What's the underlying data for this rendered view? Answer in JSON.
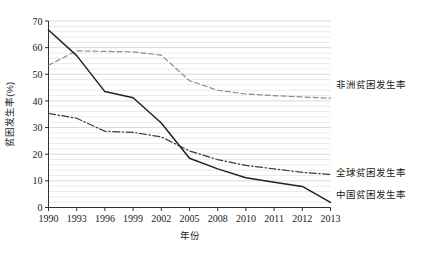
{
  "chart_data": {
    "type": "line",
    "title": "",
    "xlabel": "年份",
    "ylabel": "贫困发生率(%)",
    "xlim": [
      0,
      10
    ],
    "ylim": [
      0,
      70
    ],
    "grid": true,
    "grid_style": "horizontal-dense",
    "legend_position": "inline-right",
    "categories": [
      "1990",
      "1993",
      "1996",
      "1999",
      "2002",
      "2005",
      "2008",
      "2010",
      "2011",
      "2012",
      "2013"
    ],
    "x_tick_labels": [
      "1990",
      "1993",
      "1996",
      "1999",
      "2002",
      "2005",
      "2008",
      "2010",
      "2011",
      "2012",
      "2013"
    ],
    "y_tick_labels": [
      "0",
      "10",
      "20",
      "30",
      "40",
      "50",
      "60",
      "70"
    ],
    "y_ticks": [
      0,
      10,
      20,
      30,
      40,
      50,
      60,
      70
    ],
    "series": [
      {
        "name": "非洲贫困发生率",
        "label": "非洲贫困发生率",
        "style": "dashed",
        "color": "#8c8c8c",
        "values": [
          53.4,
          58.8,
          58.6,
          58.4,
          57.2,
          47.6,
          44.0,
          42.6,
          42.0,
          41.5,
          41.0
        ]
      },
      {
        "name": "全球贫困发生率",
        "label": "全球贫困发生率",
        "style": "dash-dot",
        "color": "#3a3a3a",
        "values": [
          35.3,
          33.5,
          28.6,
          28.2,
          26.5,
          21.2,
          18.0,
          15.8,
          14.5,
          13.2,
          12.4
        ]
      },
      {
        "name": "中国贫困发生率",
        "label": "中国贫困发生率",
        "style": "solid",
        "color": "#222222",
        "values": [
          66.6,
          57.0,
          43.5,
          41.2,
          31.7,
          18.5,
          14.5,
          11.2,
          9.5,
          7.9,
          1.9
        ]
      }
    ]
  }
}
